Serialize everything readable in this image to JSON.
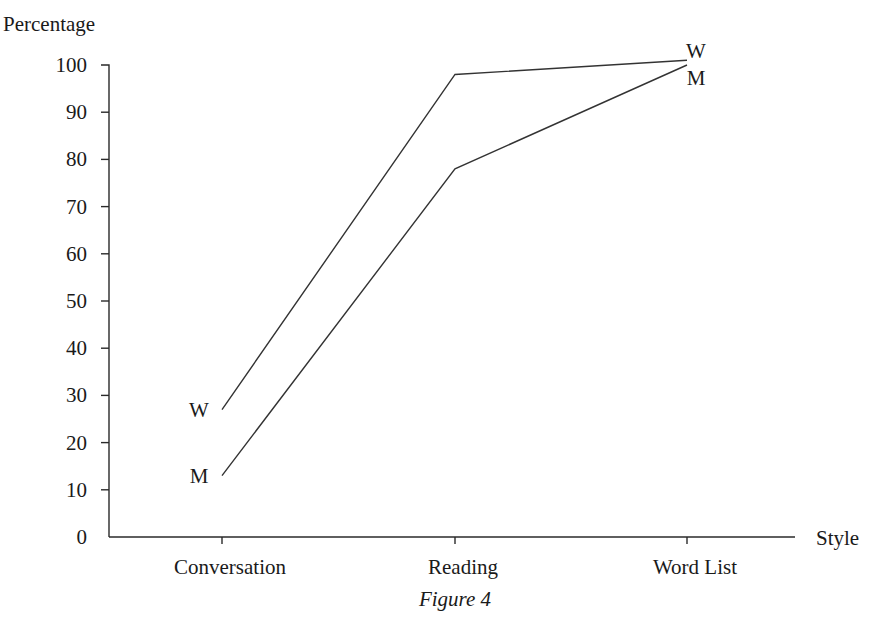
{
  "chart_data": {
    "type": "line",
    "title": "",
    "caption": "Figure 4",
    "xlabel": "Style",
    "ylabel": "Percentage",
    "categories": [
      "Conversation",
      "Reading",
      "Word List"
    ],
    "series": [
      {
        "name": "W",
        "label": "W",
        "values": [
          27,
          98,
          101
        ]
      },
      {
        "name": "M",
        "label": "M",
        "values": [
          13,
          78,
          100
        ]
      }
    ],
    "ylim": [
      0,
      100
    ],
    "yticks": [
      0,
      10,
      20,
      30,
      40,
      50,
      60,
      70,
      80,
      90,
      100
    ],
    "grid": false,
    "legend": "inline labels at line ends"
  },
  "layout": {
    "colors": {
      "axis": "#2a2a2a",
      "line": "#333333",
      "text": "#1a1a1a",
      "background": "#ffffff"
    }
  }
}
